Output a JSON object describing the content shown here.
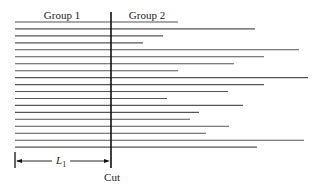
{
  "diagram": {
    "group_left_label": "Group 1",
    "group_right_label": "Group 2",
    "cut_label": "Cut",
    "dimension_label": "L",
    "dimension_subscript": "1",
    "line_count": 19,
    "line_color": "#555555",
    "cut_color": "#111111"
  }
}
